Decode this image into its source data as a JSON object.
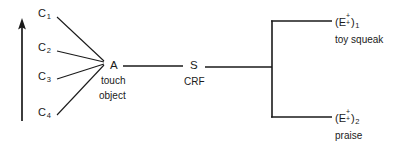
{
  "diagram": {
    "type": "behavior-chain-diagram",
    "background_color": "#ffffff",
    "ink_color": "#1a1a1a",
    "time_arrow": {
      "name": "upward-arrow",
      "direction": "up",
      "label": ""
    },
    "cues": [
      {
        "id": "c1",
        "base": "C",
        "subscript": "1",
        "x": 40,
        "y": 13
      },
      {
        "id": "c2",
        "base": "C",
        "subscript": "2",
        "x": 40,
        "y": 47
      },
      {
        "id": "c3",
        "base": "C",
        "subscript": "3",
        "x": 40,
        "y": 76
      },
      {
        "id": "c4",
        "base": "C",
        "subscript": "4",
        "x": 40,
        "y": 112
      }
    ],
    "nodes": [
      {
        "id": "node-a",
        "symbol": "A",
        "lines": [
          "touch",
          "object"
        ]
      },
      {
        "id": "node-s",
        "symbol": "S",
        "lines": [
          "CRF"
        ]
      }
    ],
    "outcomes": [
      {
        "id": "outcome-1",
        "open_paren": "(",
        "base": "E",
        "superscript": "+",
        "subscript": "+",
        "close_paren": ")",
        "index": "1",
        "description": "toy squeak"
      },
      {
        "id": "outcome-2",
        "open_paren": "(",
        "base": "E",
        "superscript": "+",
        "subscript": "+",
        "close_paren": ")",
        "index": "2",
        "description": "praise"
      }
    ]
  }
}
